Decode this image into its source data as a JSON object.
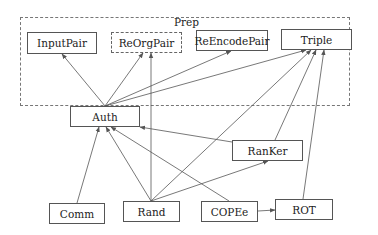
{
  "group": {
    "label": "Prep",
    "x": 20,
    "y": 17,
    "w": 330,
    "h": 89
  },
  "nodes": [
    {
      "id": "InputPair",
      "label": "InputPair",
      "x": 27,
      "y": 32,
      "w": 70,
      "h": 22,
      "style": "solid"
    },
    {
      "id": "ReOrgPair",
      "label": "ReOrgPair",
      "x": 111,
      "y": 32,
      "w": 71,
      "h": 21,
      "style": "dashed"
    },
    {
      "id": "ReEncodePair",
      "label": "ReEncodePair",
      "x": 196,
      "y": 30,
      "w": 72,
      "h": 21,
      "style": "solid"
    },
    {
      "id": "Triple",
      "label": "Triple",
      "x": 281,
      "y": 29,
      "w": 71,
      "h": 21,
      "style": "solid"
    },
    {
      "id": "Auth",
      "label": "Auth",
      "x": 70,
      "y": 106,
      "w": 70,
      "h": 21,
      "style": "solid"
    },
    {
      "id": "RanKer",
      "label": "RanKer",
      "x": 232,
      "y": 140,
      "w": 71,
      "h": 21,
      "style": "solid"
    },
    {
      "id": "Comm",
      "label": "Comm",
      "x": 49,
      "y": 203,
      "w": 56,
      "h": 21,
      "style": "solid"
    },
    {
      "id": "Rand",
      "label": "Rand",
      "x": 123,
      "y": 201,
      "w": 57,
      "h": 21,
      "style": "solid"
    },
    {
      "id": "COPEe",
      "label": "COPEe",
      "x": 201,
      "y": 201,
      "w": 57,
      "h": 21,
      "style": "solid"
    },
    {
      "id": "ROT",
      "label": "ROT",
      "x": 275,
      "y": 199,
      "w": 58,
      "h": 21,
      "style": "solid"
    }
  ],
  "edges": [
    {
      "from": "Auth",
      "to": "InputPair",
      "x1": 105,
      "y1": 106,
      "x2": 62,
      "y2": 54
    },
    {
      "from": "Auth",
      "to": "ReOrgPair",
      "x1": 105,
      "y1": 106,
      "x2": 143,
      "y2": 53
    },
    {
      "from": "Auth",
      "to": "ReEncodePair",
      "x1": 105,
      "y1": 106,
      "x2": 231,
      "y2": 51
    },
    {
      "from": "Auth",
      "to": "Triple",
      "x1": 105,
      "y1": 106,
      "x2": 306,
      "y2": 50
    },
    {
      "from": "Rand",
      "to": "ReOrgPair",
      "x1": 151,
      "y1": 201,
      "x2": 151,
      "y2": 53
    },
    {
      "from": "Rand",
      "to": "Auth",
      "x1": 151,
      "y1": 201,
      "x2": 106,
      "y2": 127
    },
    {
      "from": "Rand",
      "to": "Triple",
      "x1": 151,
      "y1": 201,
      "x2": 311,
      "y2": 50
    },
    {
      "from": "Rand",
      "to": "RanKer",
      "x1": 151,
      "y1": 201,
      "x2": 268,
      "y2": 161
    },
    {
      "from": "Comm",
      "to": "Auth",
      "x1": 77,
      "y1": 203,
      "x2": 99,
      "y2": 127
    },
    {
      "from": "COPEe",
      "to": "Auth",
      "x1": 229,
      "y1": 201,
      "x2": 111,
      "y2": 127
    },
    {
      "from": "COPEe",
      "to": "ROT",
      "x1": 258,
      "y1": 211,
      "x2": 275,
      "y2": 210
    },
    {
      "from": "RanKer",
      "to": "Triple",
      "x1": 275,
      "y1": 140,
      "x2": 316,
      "y2": 50
    },
    {
      "from": "RanKer",
      "to": "Auth",
      "x1": 232,
      "y1": 142,
      "x2": 140,
      "y2": 127
    },
    {
      "from": "ROT",
      "to": "Triple",
      "x1": 303,
      "y1": 199,
      "x2": 324,
      "y2": 50
    }
  ],
  "colors": {
    "line": "#555555",
    "border": "#555555",
    "text": "#222222",
    "background": "#ffffff"
  }
}
